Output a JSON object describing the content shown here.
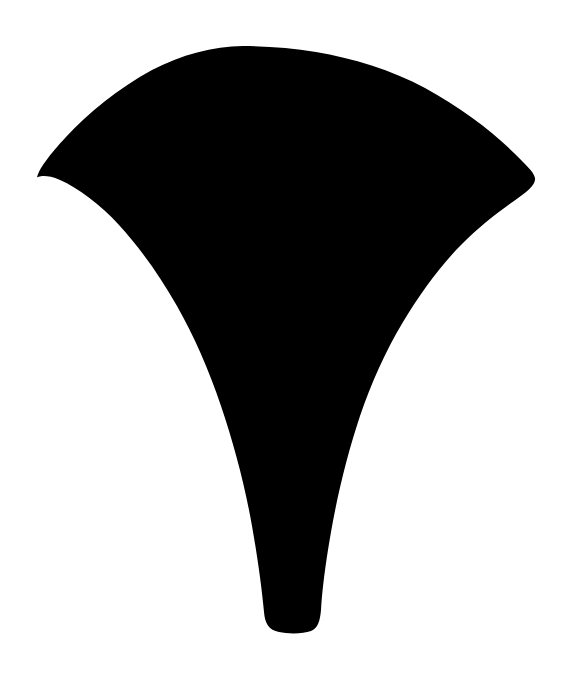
{
  "image": {
    "kind": "silhouette",
    "subject_name": "ginkgo-leaf-silhouette",
    "description": "Solid black fan-shaped ginkgo leaf silhouette with a tapering stem, centered on a plain white background",
    "width": 571,
    "height": 677,
    "background_color": "#ffffff",
    "foreground_color": "#000000",
    "orientation": "upright, stem at bottom"
  },
  "shape": {
    "name": "leaf-blade-and-stem",
    "fill": "#000000",
    "path": "M 243 46 C 268 46 292 48 316 52 C 352 58 392 70 425 88 C 460 107 492 131 514 153 C 525 164 534 172 535 178 C 536 185 527 192 514 201 C 497 213 478 228 462 244 C 440 266 420 294 403 322 C 385 352 371 384 360 416 C 348 452 338 492 331 532 C 325 566 322 592 321 610 C 320 621 318 628 311 631 C 303 634 288 634 279 632 C 269 630 265 624 264 612 C 262 590 258 560 252 526 C 245 486 234 444 221 406 C 209 370 194 336 177 306 C 160 276 140 248 119 225 C 100 204 78 188 60 180 C 45 173 36 177 37 178 C 38 170 50 154 66 137 C 88 113 119 88 152 70 C 181 55 213 46 243 46 Z",
    "key_points": {
      "top_apex": [
        243,
        46
      ],
      "left_tip": [
        37,
        178
      ],
      "right_tip": [
        535,
        178
      ],
      "stem_bottom_left": [
        264,
        628
      ],
      "stem_bottom_right": [
        320,
        628
      ],
      "lowest_point_y": 631
    }
  }
}
